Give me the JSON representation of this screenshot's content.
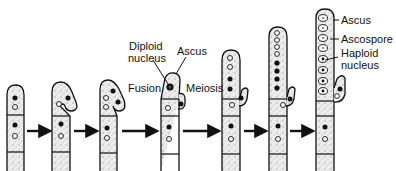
{
  "stages": [
    {
      "id": 1,
      "description": "Dikaryotic hyphal tip"
    },
    {
      "id": 2,
      "description": "Hook (crozier) forming"
    },
    {
      "id": 3,
      "description": "Nuclei divide in crozier"
    },
    {
      "id": 4,
      "description": "Fusion of nuclei into diploid nucleus in ascus"
    },
    {
      "id": 5,
      "description": "Meiosis: four nuclei"
    },
    {
      "id": 6,
      "description": "Mitosis: eight nuclei"
    },
    {
      "id": 7,
      "description": "Mature ascus with eight ascospores"
    }
  ],
  "labels": {
    "diploid_nucleus": [
      "Diploid",
      "nucleus"
    ],
    "ascus_stage4": "Ascus",
    "fusion": "Fusion",
    "meiosis": "Meiosis",
    "ascus_stage7": "Ascus",
    "ascospore": "Ascospore",
    "haploid_nucleus": [
      "Haploid",
      "nucleus"
    ]
  },
  "colors": {
    "outline": "#111111",
    "fill": "#e6e6e6",
    "stipple": "#555555",
    "background": "#ffffff"
  }
}
